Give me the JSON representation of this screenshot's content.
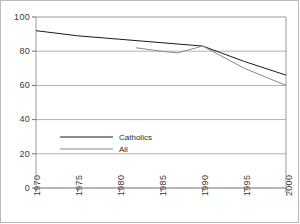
{
  "chart_data": {
    "type": "line",
    "title": "",
    "xlabel": "",
    "ylabel": "",
    "xlim": [
      1970,
      2000
    ],
    "ylim": [
      0,
      100
    ],
    "grid": true,
    "grid_axis": "y",
    "legend_position": "inner-lower-left",
    "xticks": [
      "1970",
      "1975",
      "1980",
      "1985",
      "1990",
      "1995",
      "2000"
    ],
    "xtick_values": [
      1970,
      1975,
      1980,
      1985,
      1990,
      1995,
      2000
    ],
    "yticks": [
      "0",
      "20",
      "40",
      "60",
      "80",
      "100"
    ],
    "ytick_values": [
      0,
      20,
      40,
      60,
      80,
      100
    ],
    "series": [
      {
        "name": "Catholics",
        "color": "#1a1a1a",
        "x": [
          1970,
          1975,
          1980,
          1985,
          1990,
          1995,
          2000
        ],
        "values": [
          92,
          89,
          87,
          85,
          83,
          74,
          66
        ]
      },
      {
        "name": "All",
        "color": "#8a8a8a",
        "x": [
          1982,
          1985,
          1987,
          1990,
          1995,
          2000
        ],
        "values": [
          82,
          80,
          79,
          83,
          70,
          60
        ]
      }
    ],
    "legend": [
      {
        "label": "Catholics",
        "color": "#1a1a1a"
      },
      {
        "label": "All",
        "color": "#8a8a8a"
      }
    ]
  }
}
